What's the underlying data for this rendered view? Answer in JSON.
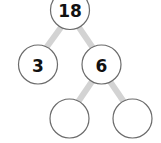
{
  "diagram": {
    "type": "factor-tree",
    "root": {
      "label": "18"
    },
    "level1": [
      {
        "label": "3"
      },
      {
        "label": "6"
      }
    ],
    "level2": [
      {
        "label": ""
      },
      {
        "label": ""
      }
    ],
    "colors": {
      "connector": "#d3d3d3",
      "circle_stroke": "#6b6b6b",
      "text": "#111111",
      "background": "#ffffff"
    }
  }
}
